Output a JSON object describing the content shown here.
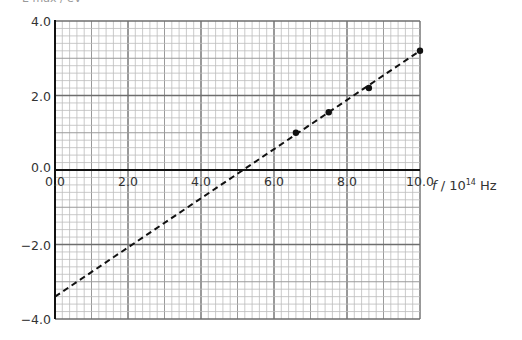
{
  "top_label_partial": "E max / eV",
  "chart_data": {
    "type": "scatter",
    "title": "",
    "xlabel": "f / 10^14 Hz",
    "xlabel_parts": {
      "var": "f",
      "unit_base": " / 10",
      "unit_exp": "14",
      "unit_tail": " Hz"
    },
    "ylabel": "",
    "xlim": [
      0.0,
      10.0
    ],
    "ylim": [
      -4.0,
      4.0
    ],
    "x_ticks": [
      "0.0",
      "2.0",
      "4.0",
      "6.0",
      "8.0",
      "10.0"
    ],
    "y_ticks": [
      "4.0",
      "2.0",
      "0.0",
      "-2.0",
      "-4.0"
    ],
    "grid": {
      "on": true,
      "major_step": 2.0,
      "mid_step": 1.0,
      "minor_step": 0.2
    },
    "legend": null,
    "series": [
      {
        "name": "data points",
        "kind": "scatter",
        "x": [
          6.6,
          7.5,
          8.6,
          10.0
        ],
        "y": [
          1.0,
          1.55,
          2.2,
          3.2
        ]
      },
      {
        "name": "best-fit line",
        "kind": "line",
        "style": "dashed",
        "x": [
          0.0,
          10.0
        ],
        "y": [
          -3.4,
          3.2
        ]
      }
    ],
    "annotations": {
      "x_intercept": 5.1,
      "y_intercept": -3.4
    }
  },
  "colors": {
    "minor_grid": "#bdbdbd",
    "mid_grid": "#9a9a9a",
    "major_grid": "#6e6e6e",
    "axis": "#111111",
    "points": "#111111",
    "fit_line": "#111111"
  }
}
